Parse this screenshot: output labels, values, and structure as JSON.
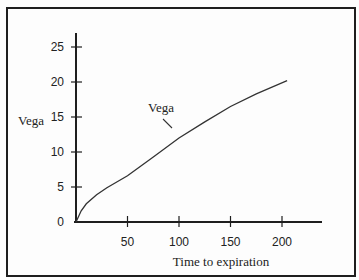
{
  "top_clipped_text": "... y to a given  money",
  "chart_data": {
    "type": "line",
    "title": "",
    "xlabel": "Time to expiration",
    "ylabel": "Vega",
    "xlim": [
      0,
      240
    ],
    "ylim": [
      0,
      27
    ],
    "x_ticks": [
      50,
      100,
      150,
      200
    ],
    "y_ticks": [
      0,
      5,
      10,
      15,
      20,
      25
    ],
    "grid": false,
    "legend": null,
    "annotations": [
      {
        "text": "Vega",
        "points_to": [
          95,
          13
        ]
      }
    ],
    "series": [
      {
        "name": "Vega",
        "x": [
          0,
          5,
          10,
          20,
          30,
          50,
          75,
          100,
          125,
          150,
          175,
          205
        ],
        "values": [
          0,
          1.6,
          2.6,
          3.9,
          4.9,
          6.6,
          9.3,
          12.0,
          14.3,
          16.5,
          18.3,
          20.2
        ]
      }
    ]
  }
}
